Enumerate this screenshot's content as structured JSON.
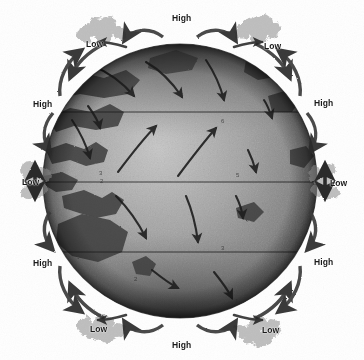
{
  "figure": {
    "kind": "atmospheric-circulation-globe",
    "background_color": "#ffffff",
    "ink_color": "#1f1f1f",
    "globe": {
      "center_x": 180,
      "center_y": 181,
      "radius": 137,
      "ocean_color": "#9a9a9a",
      "land_color": "#4a4a4a",
      "polar_shade_color": "#3a3a3a"
    },
    "latitude_lines": [
      {
        "name": "30N",
        "y": 112
      },
      {
        "name": "equator",
        "y": 182
      },
      {
        "name": "30S",
        "y": 252
      }
    ]
  },
  "pressure_labels": [
    {
      "id": "high-top-center",
      "text": "High",
      "x": 172,
      "y": 14
    },
    {
      "id": "low-top-left",
      "text": "Low",
      "x": 86,
      "y": 40
    },
    {
      "id": "low-top-right",
      "text": "Low",
      "x": 264,
      "y": 42
    },
    {
      "id": "high-left-north",
      "text": "High",
      "x": 33,
      "y": 100
    },
    {
      "id": "high-right-north",
      "text": "High",
      "x": 314,
      "y": 99
    },
    {
      "id": "low-left-equator",
      "text": "Low",
      "x": 22,
      "y": 178
    },
    {
      "id": "low-right-equator",
      "text": "Low",
      "x": 330,
      "y": 179
    },
    {
      "id": "high-left-south",
      "text": "High",
      "x": 33,
      "y": 259
    },
    {
      "id": "high-right-south",
      "text": "High",
      "x": 314,
      "y": 258
    },
    {
      "id": "low-bottom-left",
      "text": "Low",
      "x": 90,
      "y": 325
    },
    {
      "id": "low-bottom-right",
      "text": "Low",
      "x": 262,
      "y": 326
    },
    {
      "id": "high-bottom-center",
      "text": "High",
      "x": 172,
      "y": 341
    }
  ],
  "interior_marks": [
    {
      "id": "mark-a",
      "text": "4",
      "x": 180,
      "y": 92
    },
    {
      "id": "mark-b",
      "text": "6",
      "x": 221,
      "y": 118
    },
    {
      "id": "mark-c",
      "text": "3",
      "x": 99,
      "y": 170
    },
    {
      "id": "mark-d",
      "text": "5",
      "x": 236,
      "y": 172
    },
    {
      "id": "mark-e",
      "text": "2",
      "x": 100,
      "y": 178
    },
    {
      "id": "mark-f",
      "text": "3",
      "x": 221,
      "y": 245
    },
    {
      "id": "mark-g",
      "text": "2",
      "x": 134,
      "y": 276
    },
    {
      "id": "mark-h",
      "text": "1",
      "x": 235,
      "y": 298
    }
  ]
}
